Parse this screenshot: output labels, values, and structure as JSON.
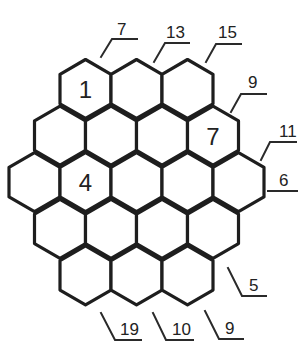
{
  "puzzle": {
    "colors": {
      "line": "#1e1e1e",
      "text": "#222222",
      "background": "#ffffff"
    },
    "grid": {
      "type": "hexagonal",
      "rows": [
        3,
        4,
        5,
        4,
        3
      ],
      "total_cells": 19
    },
    "given_cells": [
      {
        "row": 0,
        "col": 0,
        "value": "1"
      },
      {
        "row": 1,
        "col": 3,
        "value": "7"
      },
      {
        "row": 2,
        "col": 1,
        "value": "4"
      }
    ],
    "edge_clues": [
      {
        "id": "top-1",
        "value": "7"
      },
      {
        "id": "top-2",
        "value": "13"
      },
      {
        "id": "top-3",
        "value": "15"
      },
      {
        "id": "upper-right-1",
        "value": "9"
      },
      {
        "id": "upper-right-2",
        "value": "11"
      },
      {
        "id": "right-middle",
        "value": "6"
      },
      {
        "id": "lower-right",
        "value": "5"
      },
      {
        "id": "bottom-3",
        "value": "9"
      },
      {
        "id": "bottom-2",
        "value": "10"
      },
      {
        "id": "bottom-1",
        "value": "19"
      }
    ]
  }
}
